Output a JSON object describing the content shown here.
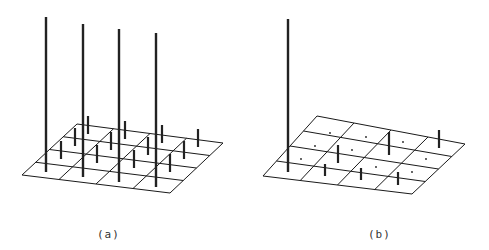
{
  "figure": {
    "panels": [
      {
        "id": "a",
        "caption": "(a)",
        "grid": {
          "rows": 4,
          "cols": 4,
          "corners": {
            "back_left": [
              77,
              124
            ],
            "back_right": [
              223,
              143
            ],
            "front_right": [
              170,
              193
            ],
            "front_left": [
              22,
              175
            ]
          }
        },
        "tall_bars": [
          {
            "x": 46,
            "top": 17,
            "bottom": 172
          },
          {
            "x": 83,
            "top": 24,
            "bottom": 177
          },
          {
            "x": 119,
            "top": 29,
            "bottom": 182
          },
          {
            "x": 156,
            "top": 33,
            "bottom": 187
          }
        ],
        "short_bars": [
          {
            "x": 88,
            "top": 116,
            "bottom": 134
          },
          {
            "x": 125,
            "top": 121,
            "bottom": 139
          },
          {
            "x": 162,
            "top": 125,
            "bottom": 143
          },
          {
            "x": 198,
            "top": 129,
            "bottom": 147
          },
          {
            "x": 75,
            "top": 128,
            "bottom": 146
          },
          {
            "x": 111,
            "top": 132,
            "bottom": 150
          },
          {
            "x": 148,
            "top": 137,
            "bottom": 155
          },
          {
            "x": 184,
            "top": 141,
            "bottom": 159
          },
          {
            "x": 61,
            "top": 141,
            "bottom": 159
          },
          {
            "x": 97,
            "top": 145,
            "bottom": 163
          },
          {
            "x": 134,
            "top": 150,
            "bottom": 168
          },
          {
            "x": 170,
            "top": 154,
            "bottom": 172
          }
        ],
        "dots": []
      },
      {
        "id": "b",
        "caption": "(b)",
        "grid": {
          "rows": 4,
          "cols": 4,
          "corners": {
            "back_left": [
              317,
              116
            ],
            "back_right": [
              465,
              144
            ],
            "front_right": [
              412,
              194
            ],
            "front_left": [
              263,
              176
            ]
          }
        },
        "tall_bars": [
          {
            "x": 288,
            "top": 19,
            "bottom": 172
          }
        ],
        "short_bars": [
          {
            "x": 439,
            "top": 130,
            "bottom": 148
          },
          {
            "x": 389,
            "top": 132,
            "bottom": 155
          },
          {
            "x": 338,
            "top": 145,
            "bottom": 163
          },
          {
            "x": 325,
            "top": 164,
            "bottom": 176
          },
          {
            "x": 361,
            "top": 168,
            "bottom": 180
          },
          {
            "x": 398,
            "top": 172,
            "bottom": 185
          }
        ],
        "dots": [
          [
            330,
            133
          ],
          [
            366,
            137
          ],
          [
            403,
            142
          ],
          [
            315,
            146
          ],
          [
            352,
            150
          ],
          [
            301,
            159
          ],
          [
            376,
            167
          ],
          [
            426,
            159
          ],
          [
            412,
            172
          ]
        ]
      }
    ],
    "colors": {
      "grid": "#1a1a1a",
      "bar": "#222222",
      "background": "#ffffff"
    }
  }
}
